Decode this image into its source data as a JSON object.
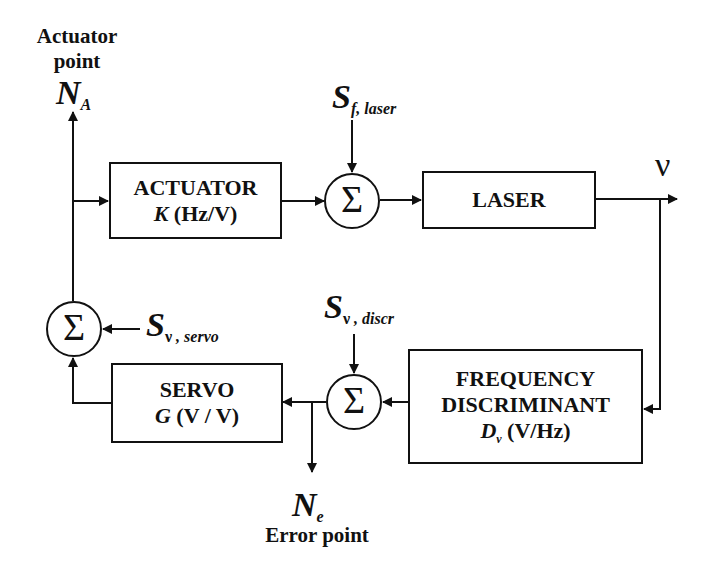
{
  "diagram": {
    "type": "block-diagram",
    "colors": {
      "line": "#111111",
      "background": "#ffffff"
    },
    "labels": {
      "actuator_point": {
        "line1": "Actuator",
        "line2": "point",
        "symbol": "N",
        "subscript": "A"
      },
      "error_point": {
        "symbol": "N",
        "subscript": "e",
        "caption": "Error point"
      },
      "output": {
        "symbol": "ν"
      }
    },
    "blocks": {
      "actuator": {
        "title": "ACTUATOR",
        "gain_symbol": "K",
        "units": " (Hz/V)"
      },
      "laser": {
        "title": "LASER"
      },
      "frequency_discriminant": {
        "line1": "FREQUENCY",
        "line2": "DISCRIMINANT",
        "gain_symbol": "D",
        "gain_subscript": "ν",
        "units": " (V/Hz)"
      },
      "servo": {
        "title": "SERVO",
        "gain_symbol": "G",
        "units": " (V / V)"
      }
    },
    "summing_junctions": {
      "laser_noise": {
        "glyph": "Σ"
      },
      "discriminator_noise": {
        "glyph": "Σ"
      },
      "servo_noise": {
        "glyph": "Σ"
      }
    },
    "noise_sources": {
      "laser": {
        "symbol": "S",
        "subscript": "f, laser"
      },
      "discriminator": {
        "symbol": "S",
        "subscript_greek": "ν",
        "subscript": " , discr"
      },
      "servo": {
        "symbol": "S",
        "subscript_greek": "ν",
        "subscript": " , servo"
      }
    },
    "signal_flow": [
      "N_A -> ACTUATOR",
      "ACTUATOR -> Σ(S_f,laser)",
      "Σ -> LASER",
      "LASER -> ν",
      "ν -> FREQUENCY DISCRIMINANT",
      "FREQUENCY DISCRIMINANT -> Σ(S_ν,discr)",
      "Σ -> N_e",
      "Σ -> SERVO",
      "SERVO -> Σ(S_ν,servo)",
      "Σ -> N_A"
    ]
  }
}
